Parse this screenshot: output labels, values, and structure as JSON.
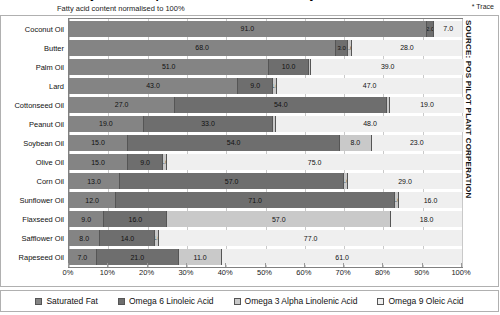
{
  "header": {
    "title_clipped": "Fatty Acid Composition of Common Dietary Fats",
    "subtitle": "Fatty acid content normalised to 100%",
    "trace_note": "* Trace",
    "source": "SOURCE: POS PILOT PLANT CORPERATION"
  },
  "legend": {
    "items": [
      {
        "label": "Saturated Fat",
        "color": "#848484"
      },
      {
        "label": "Omega 6 Linoleic Acid",
        "color": "#6e6e6e"
      },
      {
        "label": "Omega 3 Alpha Linolenic Acid",
        "color": "#c9c9c9"
      },
      {
        "label": "Omega 9 Oleic Acid",
        "color": "#efefef"
      }
    ]
  },
  "axis": {
    "ticks": [
      "0%",
      "10%",
      "20%",
      "30%",
      "40%",
      "50%",
      "60%",
      "70%",
      "80%",
      "90%",
      "100%"
    ],
    "min": 0,
    "max": 100
  },
  "chart_data": {
    "type": "bar",
    "orientation": "horizontal",
    "stacked": true,
    "normalised_percent": true,
    "title": "Fatty Acid Composition of Common Dietary Fats",
    "subtitle": "Fatty acid content normalised to 100%",
    "xlabel": "",
    "ylabel": "",
    "xlim": [
      0,
      100
    ],
    "grid": true,
    "legend_position": "bottom",
    "annotation": "* Trace",
    "source": "SOURCE: POS PILOT PLANT CORPERATION",
    "categories": [
      "Coconut Oil",
      "Butter",
      "Palm Oil",
      "Lard",
      "Cottonseed Oil",
      "Peanut Oil",
      "Soybean Oil",
      "Olive Oil",
      "Corn Oil",
      "Sunflower Oil",
      "Flaxseed Oil",
      "Safflower Oil",
      "Rapeseed Oil"
    ],
    "series": [
      {
        "name": "Saturated Fat",
        "values": [
          91.0,
          68.0,
          51.0,
          43.0,
          27.0,
          19.0,
          15.0,
          15.0,
          13.0,
          12.0,
          9.0,
          8.0,
          7.0
        ]
      },
      {
        "name": "Omega 6 Linoleic Acid",
        "values": [
          2.0,
          3.0,
          10.0,
          9.0,
          54.0,
          33.0,
          54.0,
          9.0,
          57.0,
          71.0,
          16.0,
          14.0,
          21.0
        ]
      },
      {
        "name": "Omega 3 Alpha Linolenic Acid",
        "values": [
          0.0,
          1.0,
          0.0,
          1.0,
          0.0,
          0.0,
          8.0,
          1.0,
          1.0,
          1.0,
          57.0,
          1.0,
          11.0
        ]
      },
      {
        "name": "Omega 9 Oleic Acid",
        "values": [
          7.0,
          28.0,
          39.0,
          47.0,
          19.0,
          48.0,
          23.0,
          75.0,
          29.0,
          16.0,
          18.0,
          77.0,
          61.0
        ]
      }
    ],
    "rows": [
      {
        "category": "Coconut Oil",
        "cells": [
          {
            "label": "91.0",
            "value": 91.0,
            "trace": false
          },
          {
            "label": "2.0",
            "value": 2.0,
            "trace": false
          },
          {
            "label": "",
            "value": 0.0,
            "trace": false
          },
          {
            "label": "7.0",
            "value": 7.0,
            "trace": false
          }
        ]
      },
      {
        "category": "Butter",
        "cells": [
          {
            "label": "68.0",
            "value": 68.0,
            "trace": false
          },
          {
            "label": "3.0",
            "value": 3.0,
            "trace": false
          },
          {
            "label": "1.0",
            "value": 1.0,
            "trace": false
          },
          {
            "label": "28.0",
            "value": 28.0,
            "trace": false
          }
        ]
      },
      {
        "category": "Palm Oil",
        "cells": [
          {
            "label": "51.0",
            "value": 51.0,
            "trace": false
          },
          {
            "label": "10.0",
            "value": 10.0,
            "trace": false
          },
          {
            "label": "*",
            "value": 0.6,
            "trace": true
          },
          {
            "label": "39.0",
            "value": 39.0,
            "trace": false
          }
        ]
      },
      {
        "category": "Lard",
        "cells": [
          {
            "label": "43.0",
            "value": 43.0,
            "trace": false
          },
          {
            "label": "9.0",
            "value": 9.0,
            "trace": false
          },
          {
            "label": "1.0",
            "value": 1.0,
            "trace": false
          },
          {
            "label": "47.0",
            "value": 47.0,
            "trace": false
          }
        ]
      },
      {
        "category": "Cottonseed Oil",
        "cells": [
          {
            "label": "27.0",
            "value": 27.0,
            "trace": false
          },
          {
            "label": "54.0",
            "value": 54.0,
            "trace": false
          },
          {
            "label": "*",
            "value": 0.6,
            "trace": true
          },
          {
            "label": "19.0",
            "value": 19.0,
            "trace": false
          }
        ]
      },
      {
        "category": "Peanut Oil",
        "cells": [
          {
            "label": "19.0",
            "value": 19.0,
            "trace": false
          },
          {
            "label": "33.0",
            "value": 33.0,
            "trace": false
          },
          {
            "label": "*",
            "value": 0.6,
            "trace": true
          },
          {
            "label": "48.0",
            "value": 48.0,
            "trace": false
          }
        ]
      },
      {
        "category": "Soybean Oil",
        "cells": [
          {
            "label": "15.0",
            "value": 15.0,
            "trace": false
          },
          {
            "label": "54.0",
            "value": 54.0,
            "trace": false
          },
          {
            "label": "8.0",
            "value": 8.0,
            "trace": false
          },
          {
            "label": "23.0",
            "value": 23.0,
            "trace": false
          }
        ]
      },
      {
        "category": "Olive Oil",
        "cells": [
          {
            "label": "15.0",
            "value": 15.0,
            "trace": false
          },
          {
            "label": "9.0",
            "value": 9.0,
            "trace": false
          },
          {
            "label": "1.0",
            "value": 1.0,
            "trace": false
          },
          {
            "label": "75.0",
            "value": 75.0,
            "trace": false
          }
        ]
      },
      {
        "category": "Corn Oil",
        "cells": [
          {
            "label": "13.0",
            "value": 13.0,
            "trace": false
          },
          {
            "label": "57.0",
            "value": 57.0,
            "trace": false
          },
          {
            "label": "1.0",
            "value": 1.0,
            "trace": false
          },
          {
            "label": "29.0",
            "value": 29.0,
            "trace": false
          }
        ]
      },
      {
        "category": "Sunflower Oil",
        "cells": [
          {
            "label": "12.0",
            "value": 12.0,
            "trace": false
          },
          {
            "label": "71.0",
            "value": 71.0,
            "trace": false
          },
          {
            "label": "1.0",
            "value": 1.0,
            "trace": false
          },
          {
            "label": "16.0",
            "value": 16.0,
            "trace": false
          }
        ]
      },
      {
        "category": "Flaxseed Oil",
        "cells": [
          {
            "label": "9.0",
            "value": 9.0,
            "trace": false
          },
          {
            "label": "16.0",
            "value": 16.0,
            "trace": false
          },
          {
            "label": "57.0",
            "value": 57.0,
            "trace": false
          },
          {
            "label": "18.0",
            "value": 18.0,
            "trace": false
          }
        ]
      },
      {
        "category": "Safflower Oil",
        "cells": [
          {
            "label": "8.0",
            "value": 8.0,
            "trace": false
          },
          {
            "label": "14.0",
            "value": 14.0,
            "trace": false
          },
          {
            "label": "1.0",
            "value": 1.0,
            "trace": false
          },
          {
            "label": "77.0",
            "value": 77.0,
            "trace": false
          }
        ]
      },
      {
        "category": "Rapeseed Oil",
        "cells": [
          {
            "label": "7.0",
            "value": 7.0,
            "trace": false
          },
          {
            "label": "21.0",
            "value": 21.0,
            "trace": false
          },
          {
            "label": "11.0",
            "value": 11.0,
            "trace": false
          },
          {
            "label": "61.0",
            "value": 61.0,
            "trace": false
          }
        ]
      }
    ]
  }
}
